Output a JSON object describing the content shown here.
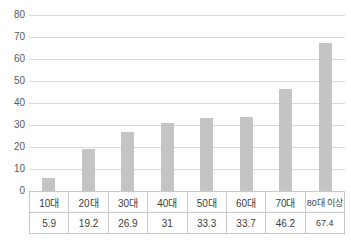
{
  "chart_data": {
    "type": "bar",
    "categories": [
      "10대",
      "20대",
      "30대",
      "40대",
      "50대",
      "60대",
      "70대",
      "80대 이상"
    ],
    "values": [
      5.9,
      19.2,
      26.9,
      31,
      33.3,
      33.7,
      46.2,
      67.4
    ],
    "value_labels": [
      "5.9",
      "19.2",
      "26.9",
      "31",
      "33.3",
      "33.7",
      "46.2",
      "67.4"
    ],
    "title": "",
    "xlabel": "",
    "ylabel": "",
    "ylim": [
      0,
      80
    ],
    "yticks": [
      0,
      10,
      20,
      30,
      40,
      50,
      60,
      70,
      80
    ],
    "grid": true,
    "legend_position": "none",
    "data_table_shown": true,
    "colors": {
      "bar": "#c4c4c4",
      "gridline": "#d9d9d9",
      "table_border": "#c9c9c9",
      "tick_text": "#595959",
      "table_text": "#3d3d3d",
      "background": "#ffffff"
    }
  }
}
